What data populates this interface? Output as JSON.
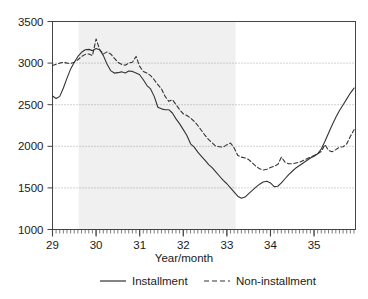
{
  "chart_data": {
    "type": "line",
    "title": "",
    "xlabel": "Year/month",
    "ylabel": "",
    "xlim": [
      29.0,
      35.95
    ],
    "ylim": [
      1000,
      3500
    ],
    "grid": true,
    "grid_values": [
      1500,
      2000,
      2500,
      3000
    ],
    "legend_position": "bottom",
    "y_ticks": [
      1000,
      1500,
      2000,
      2500,
      3000,
      3500
    ],
    "y_tick_labels": [
      "1000",
      "1500",
      "2000",
      "2500",
      "3000",
      "3500"
    ],
    "x_ticks": [
      29,
      30,
      31,
      32,
      33,
      34,
      35
    ],
    "x_tick_labels": [
      "29",
      "30",
      "31",
      "32",
      "33",
      "34",
      "35"
    ],
    "x_minor_tick_step": 0.08333,
    "shaded_regions": [
      {
        "name": "recession-band",
        "x_start": 29.6,
        "x_end": 33.2,
        "color": "#f0f0f0"
      }
    ],
    "series": [
      {
        "name": "Installment",
        "style": "solid",
        "color": "#333333",
        "x": [
          29.0,
          29.083,
          29.167,
          29.25,
          29.333,
          29.417,
          29.5,
          29.583,
          29.667,
          29.75,
          29.833,
          29.917,
          30.0,
          30.083,
          30.167,
          30.25,
          30.333,
          30.417,
          30.5,
          30.583,
          30.667,
          30.75,
          30.833,
          30.917,
          31.0,
          31.083,
          31.167,
          31.25,
          31.333,
          31.417,
          31.5,
          31.583,
          31.667,
          31.75,
          31.833,
          31.917,
          32.0,
          32.083,
          32.167,
          32.25,
          32.333,
          32.417,
          32.5,
          32.583,
          32.667,
          32.75,
          32.833,
          32.917,
          33.0,
          33.083,
          33.167,
          33.25,
          33.333,
          33.417,
          33.5,
          33.583,
          33.667,
          33.75,
          33.833,
          33.917,
          34.0,
          34.083,
          34.167,
          34.25,
          34.333,
          34.417,
          34.5,
          34.583,
          34.667,
          34.75,
          34.833,
          34.917,
          35.0,
          35.083,
          35.167,
          35.25,
          35.333,
          35.417,
          35.5,
          35.583,
          35.667,
          35.75,
          35.833,
          35.917
        ],
        "y": [
          2605,
          2575,
          2600,
          2700,
          2820,
          2930,
          3010,
          3080,
          3130,
          3160,
          3165,
          3150,
          3175,
          3160,
          3090,
          2990,
          2910,
          2880,
          2885,
          2895,
          2880,
          2905,
          2900,
          2880,
          2860,
          2800,
          2730,
          2690,
          2600,
          2470,
          2450,
          2440,
          2440,
          2400,
          2330,
          2270,
          2200,
          2130,
          2030,
          1990,
          1930,
          1880,
          1830,
          1780,
          1740,
          1690,
          1640,
          1590,
          1550,
          1500,
          1450,
          1400,
          1375,
          1390,
          1430,
          1470,
          1510,
          1545,
          1570,
          1580,
          1560,
          1515,
          1520,
          1560,
          1610,
          1660,
          1700,
          1740,
          1770,
          1800,
          1830,
          1860,
          1880,
          1910,
          1970,
          2060,
          2160,
          2260,
          2350,
          2430,
          2500,
          2570,
          2640,
          2700
        ]
      },
      {
        "name": "Non-installment",
        "style": "dashed",
        "color": "#333333",
        "x": [
          29.0,
          29.083,
          29.167,
          29.25,
          29.333,
          29.417,
          29.5,
          29.583,
          29.667,
          29.75,
          29.833,
          29.917,
          30.0,
          30.083,
          30.167,
          30.25,
          30.333,
          30.417,
          30.5,
          30.583,
          30.667,
          30.75,
          30.833,
          30.917,
          31.0,
          31.083,
          31.167,
          31.25,
          31.333,
          31.417,
          31.5,
          31.583,
          31.667,
          31.75,
          31.833,
          31.917,
          32.0,
          32.083,
          32.167,
          32.25,
          32.333,
          32.417,
          32.5,
          32.583,
          32.667,
          32.75,
          32.833,
          32.917,
          33.0,
          33.083,
          33.167,
          33.25,
          33.333,
          33.417,
          33.5,
          33.583,
          33.667,
          33.75,
          33.833,
          33.917,
          34.0,
          34.083,
          34.167,
          34.25,
          34.333,
          34.417,
          34.5,
          34.583,
          34.667,
          34.75,
          34.833,
          34.917,
          35.0,
          35.083,
          35.167,
          35.25,
          35.333,
          35.417,
          35.5,
          35.583,
          35.667,
          35.75,
          35.833,
          35.917
        ],
        "y": [
          2970,
          2985,
          3000,
          3010,
          3000,
          2995,
          3010,
          3040,
          3080,
          3105,
          3110,
          3090,
          3290,
          3160,
          3110,
          3135,
          3110,
          3060,
          3010,
          2985,
          2975,
          3000,
          3010,
          3080,
          2960,
          2900,
          2880,
          2850,
          2800,
          2740,
          2690,
          2600,
          2540,
          2560,
          2500,
          2440,
          2390,
          2370,
          2340,
          2300,
          2250,
          2190,
          2130,
          2080,
          2040,
          2000,
          1995,
          1990,
          2020,
          2040,
          1980,
          1890,
          1870,
          1860,
          1840,
          1800,
          1760,
          1730,
          1715,
          1725,
          1745,
          1760,
          1780,
          1870,
          1810,
          1790,
          1790,
          1800,
          1810,
          1830,
          1850,
          1870,
          1890,
          1910,
          1940,
          2020,
          1950,
          1935,
          1960,
          1990,
          1995,
          2030,
          2120,
          2200
        ]
      }
    ]
  },
  "legend": {
    "entries": [
      {
        "label": "Installment",
        "style": "solid"
      },
      {
        "label": "Non-installment",
        "style": "dashed"
      }
    ]
  },
  "axes": {
    "x_title": "Year/month"
  }
}
